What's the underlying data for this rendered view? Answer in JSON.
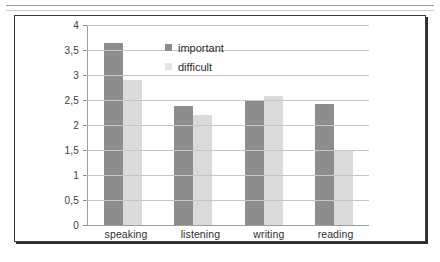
{
  "figure": {
    "frame_border_color": "#3a3a3a",
    "background": "#ffffff"
  },
  "chart_data": {
    "type": "bar",
    "title": "",
    "subtitle": "",
    "xlabel": "",
    "ylabel": "",
    "categories": [
      "speaking",
      "listening",
      "writing",
      "reading"
    ],
    "series": [
      {
        "name": "important",
        "color": "#8d8d8d",
        "values": [
          3.65,
          2.38,
          2.48,
          2.42
        ]
      },
      {
        "name": "difficult",
        "color": "#dadada",
        "values": [
          2.9,
          2.2,
          2.58,
          1.5
        ]
      }
    ],
    "ylim": [
      0,
      4
    ],
    "ytick_values": [
      0,
      0.5,
      1,
      1.5,
      2,
      2.5,
      3,
      3.5,
      4
    ],
    "ytick_labels": [
      "0",
      "0,5",
      "1",
      "1,5",
      "2",
      "2,5",
      "3",
      "3,5",
      "4"
    ],
    "decimal_separator": ",",
    "grid": true,
    "grid_axis": "y",
    "grid_color": "#c6c6c6",
    "legend_position": "inside-top-center",
    "legend_entries": [
      "important",
      "difficult"
    ],
    "annotations": []
  }
}
